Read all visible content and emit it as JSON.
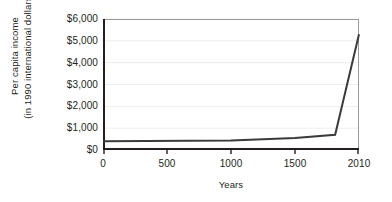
{
  "chart_data": {
    "type": "line",
    "title": "",
    "xlabel": "Years",
    "ylabel_line1": "Per capita income",
    "ylabel_line2": "(in 1990 international dollars)",
    "xlim": [
      0,
      2010
    ],
    "ylim": [
      0,
      6000
    ],
    "grid": true,
    "legend": "none",
    "x_tick_labels": [
      "0",
      "500",
      "1000",
      "1500",
      "2010"
    ],
    "x_tick_values": [
      0,
      500,
      1000,
      1500,
      2010
    ],
    "y_tick_labels": [
      "$6,000",
      "$5,000",
      "$4,000",
      "$3,000",
      "$2,000",
      "$1,000",
      "$0"
    ],
    "y_tick_values": [
      6000,
      5000,
      4000,
      3000,
      2000,
      1000,
      0
    ],
    "series": [
      {
        "name": "Per capita income",
        "color": "#3a3a3a",
        "x": [
          0,
          1000,
          1500,
          1820,
          2010
        ],
        "values": [
          400,
          430,
          550,
          700,
          5300
        ]
      }
    ]
  },
  "figure": {
    "line_color": "#3a3a3a",
    "frame_color": "#231f20",
    "grid_color": "#ededed",
    "text_color": "#231f20",
    "background": "#ffffff"
  }
}
